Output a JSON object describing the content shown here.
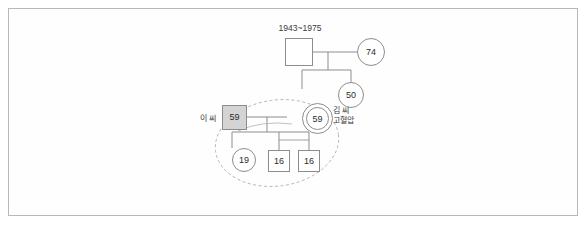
{
  "diagram": {
    "title_label": "1943~1975",
    "deceased_male": {
      "label": "",
      "note": "deceased male: square with X"
    },
    "nodes": [
      {
        "id": "gf",
        "shape": "square-x",
        "value": "",
        "x": 285,
        "y": 38,
        "size": 28
      },
      {
        "id": "gm",
        "shape": "circle",
        "value": "74",
        "x": 357,
        "y": 38,
        "size": 28
      },
      {
        "id": "aunt50",
        "shape": "circle",
        "value": "50",
        "x": 338,
        "y": 82,
        "size": 26
      },
      {
        "id": "husband59",
        "shape": "square-filled",
        "value": "59",
        "x": 222,
        "y": 105,
        "size": 25
      },
      {
        "id": "client59",
        "shape": "circle-double",
        "value": "59",
        "x": 302,
        "y": 103,
        "size": 29
      },
      {
        "id": "child19",
        "shape": "circle",
        "value": "19",
        "x": 232,
        "y": 148,
        "size": 24
      },
      {
        "id": "child16a",
        "shape": "square",
        "value": "16",
        "x": 268,
        "y": 150,
        "size": 22
      },
      {
        "id": "child16b",
        "shape": "square",
        "value": "16",
        "x": 298,
        "y": 150,
        "size": 22
      }
    ],
    "annotations": [
      {
        "id": "husband-label",
        "text": "이 씨",
        "x": 203,
        "y": 116
      },
      {
        "id": "client-label-line1",
        "text": "김 씨",
        "x": 337,
        "y": 110
      },
      {
        "id": "client-label-line2",
        "text": "고혈압",
        "x": 337,
        "y": 119
      },
      {
        "id": "dates-label",
        "text": "1943~1975",
        "x": 299,
        "y": 30
      }
    ],
    "household_ellipse": {
      "label": "household boundary",
      "cx": 277,
      "cy": 143,
      "rx": 62,
      "ry": 43,
      "rotation": -8
    },
    "colors": {
      "line": "#8d8d8d",
      "fill_shaded": "#d4d4d4",
      "text": "#2b2b2b",
      "frame": "#b9b9b9",
      "background": "#ffffff"
    }
  }
}
